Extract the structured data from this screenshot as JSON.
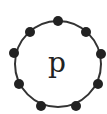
{
  "diagram": {
    "center_label": "p",
    "circle": {
      "cx": 58,
      "cy": 64,
      "r": 43,
      "stroke": "#333333"
    },
    "node_color": "#222222",
    "nodes": [
      {
        "cx": 58,
        "cy": 21
      },
      {
        "cx": 86,
        "cy": 32
      },
      {
        "cx": 101,
        "cy": 54
      },
      {
        "cx": 98,
        "cy": 84
      },
      {
        "cx": 76,
        "cy": 106
      },
      {
        "cx": 41,
        "cy": 106
      },
      {
        "cx": 19,
        "cy": 84
      },
      {
        "cx": 14,
        "cy": 53
      },
      {
        "cx": 30,
        "cy": 32
      }
    ]
  }
}
